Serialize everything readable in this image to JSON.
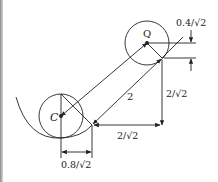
{
  "diagram": {
    "points": {
      "C": {
        "label": "C",
        "x": 61,
        "y": 116
      },
      "Q": {
        "label": "Q",
        "x": 147,
        "y": 43
      }
    },
    "circles": {
      "c_radius": 22,
      "q_radius": 22
    },
    "labels": {
      "center_c": "C",
      "center_q": "Q",
      "diagonal_length": "2",
      "vertical_dim": "2/√2",
      "horizontal_dim": "2/√2",
      "top_offset": "0.4/√2",
      "bottom_offset": "0.8/√2"
    },
    "colors": {
      "stroke": "#222222",
      "background": "#ffffff"
    }
  }
}
